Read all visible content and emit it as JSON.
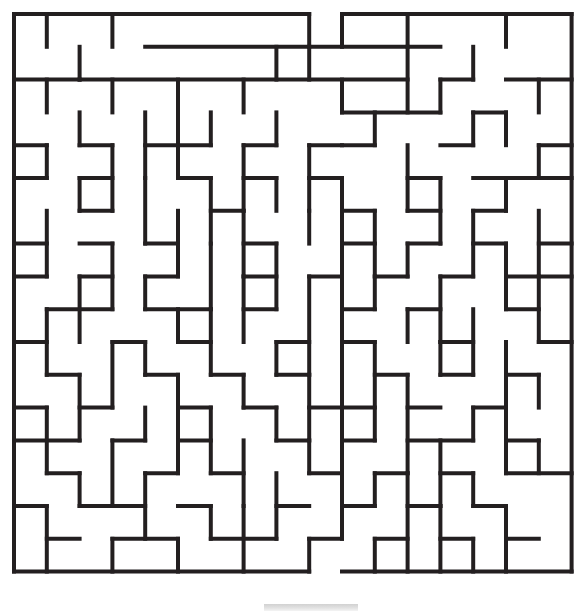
{
  "document": {
    "title": "Maze Puzzle",
    "type": "printable-maze",
    "background_color": "#ffffff"
  },
  "maze": {
    "name": "rectangular-grid-maze",
    "columns": 17,
    "rows": 17,
    "cell_size": 32.8,
    "origin_x": 14,
    "origin_y": 14,
    "wall_color": "#231f20",
    "wall_thickness": 4,
    "entrance": {
      "side": "top",
      "column": 8,
      "label": "start"
    },
    "exit": {
      "side": "bottom",
      "column": 9,
      "label": "finish"
    },
    "horizontal_walls": [
      [
        0,
        0,
        8
      ],
      [
        1,
        0,
        4
      ],
      [
        5,
        0,
        9
      ],
      [
        10,
        0,
        17
      ],
      [
        4,
        1,
        13
      ],
      [
        0,
        2,
        2
      ],
      [
        2,
        2,
        12
      ],
      [
        13,
        2,
        14
      ],
      [
        15,
        2,
        17
      ],
      [
        10,
        3,
        13
      ],
      [
        14,
        3,
        15
      ],
      [
        0,
        4,
        1
      ],
      [
        2,
        4,
        3
      ],
      [
        4,
        4,
        6
      ],
      [
        7,
        4,
        8
      ],
      [
        9,
        4,
        10
      ],
      [
        10,
        4,
        11
      ],
      [
        13,
        4,
        14
      ],
      [
        16,
        4,
        17
      ],
      [
        0,
        5,
        1
      ],
      [
        2,
        5,
        3
      ],
      [
        5,
        5,
        6
      ],
      [
        7,
        5,
        8
      ],
      [
        9,
        5,
        10
      ],
      [
        12,
        5,
        13
      ],
      [
        14,
        5,
        17
      ],
      [
        2,
        6,
        3
      ],
      [
        6,
        6,
        7
      ],
      [
        10,
        6,
        11
      ],
      [
        12,
        6,
        13
      ],
      [
        14,
        6,
        15
      ],
      [
        0,
        7,
        1
      ],
      [
        2,
        7,
        3
      ],
      [
        4,
        7,
        5
      ],
      [
        7,
        7,
        8
      ],
      [
        10,
        7,
        11
      ],
      [
        12,
        7,
        13
      ],
      [
        14,
        7,
        15
      ],
      [
        16,
        7,
        17
      ],
      [
        0,
        8,
        1
      ],
      [
        2,
        8,
        3
      ],
      [
        4,
        8,
        5
      ],
      [
        7,
        8,
        8
      ],
      [
        9,
        8,
        10
      ],
      [
        11,
        8,
        12
      ],
      [
        13,
        8,
        14
      ],
      [
        15,
        8,
        17
      ],
      [
        1,
        9,
        3
      ],
      [
        4,
        9,
        6
      ],
      [
        7,
        9,
        8
      ],
      [
        10,
        9,
        11
      ],
      [
        12,
        9,
        13
      ],
      [
        15,
        9,
        16
      ],
      [
        0,
        10,
        1
      ],
      [
        3,
        10,
        4
      ],
      [
        5,
        10,
        6
      ],
      [
        8,
        10,
        9
      ],
      [
        10,
        10,
        11
      ],
      [
        13,
        10,
        14
      ],
      [
        16,
        10,
        17
      ],
      [
        1,
        11,
        2
      ],
      [
        4,
        11,
        5
      ],
      [
        6,
        11,
        7
      ],
      [
        8,
        11,
        9
      ],
      [
        11,
        11,
        12
      ],
      [
        13,
        11,
        14
      ],
      [
        15,
        11,
        16
      ],
      [
        0,
        12,
        1
      ],
      [
        2,
        12,
        3
      ],
      [
        5,
        12,
        6
      ],
      [
        7,
        12,
        8
      ],
      [
        9,
        12,
        11
      ],
      [
        12,
        12,
        13
      ],
      [
        14,
        12,
        15
      ],
      [
        0,
        13,
        2
      ],
      [
        3,
        13,
        4
      ],
      [
        5,
        13,
        6
      ],
      [
        8,
        13,
        9
      ],
      [
        10,
        13,
        11
      ],
      [
        12,
        13,
        14
      ],
      [
        15,
        13,
        16
      ],
      [
        1,
        14,
        2
      ],
      [
        4,
        14,
        5
      ],
      [
        6,
        14,
        7
      ],
      [
        9,
        14,
        10
      ],
      [
        11,
        14,
        12
      ],
      [
        13,
        14,
        14
      ],
      [
        15,
        14,
        17
      ],
      [
        0,
        15,
        1
      ],
      [
        2,
        15,
        4
      ],
      [
        5,
        15,
        6
      ],
      [
        8,
        15,
        9
      ],
      [
        10,
        15,
        11
      ],
      [
        12,
        15,
        13
      ],
      [
        14,
        15,
        15
      ],
      [
        1,
        16,
        2
      ],
      [
        3,
        16,
        5
      ],
      [
        6,
        16,
        8
      ],
      [
        9,
        16,
        10
      ],
      [
        11,
        16,
        12
      ],
      [
        13,
        16,
        14
      ],
      [
        15,
        16,
        16
      ],
      [
        0,
        17,
        9
      ],
      [
        10,
        17,
        17
      ]
    ],
    "vertical_walls": [
      [
        0,
        0,
        17
      ],
      [
        1,
        0,
        1
      ],
      [
        3,
        0,
        1
      ],
      [
        9,
        0,
        1
      ],
      [
        10,
        0,
        1
      ],
      [
        12,
        0,
        1
      ],
      [
        15,
        0,
        1
      ],
      [
        2,
        1,
        2
      ],
      [
        8,
        1,
        2
      ],
      [
        9,
        1,
        2
      ],
      [
        12,
        1,
        3
      ],
      [
        14,
        1,
        2
      ],
      [
        1,
        2,
        3
      ],
      [
        3,
        2,
        3
      ],
      [
        5,
        2,
        4
      ],
      [
        7,
        2,
        3
      ],
      [
        10,
        2,
        3
      ],
      [
        13,
        2,
        3
      ],
      [
        16,
        2,
        3
      ],
      [
        2,
        3,
        4
      ],
      [
        4,
        3,
        5
      ],
      [
        6,
        3,
        4
      ],
      [
        8,
        3,
        4
      ],
      [
        11,
        3,
        4
      ],
      [
        14,
        3,
        4
      ],
      [
        15,
        3,
        4
      ],
      [
        1,
        4,
        5
      ],
      [
        3,
        4,
        6
      ],
      [
        5,
        4,
        5
      ],
      [
        7,
        4,
        6
      ],
      [
        9,
        4,
        6
      ],
      [
        12,
        4,
        6
      ],
      [
        16,
        4,
        5
      ],
      [
        2,
        5,
        6
      ],
      [
        4,
        5,
        7
      ],
      [
        6,
        5,
        7
      ],
      [
        8,
        5,
        6
      ],
      [
        10,
        5,
        7
      ],
      [
        13,
        5,
        7
      ],
      [
        15,
        5,
        6
      ],
      [
        1,
        6,
        8
      ],
      [
        5,
        6,
        8
      ],
      [
        7,
        6,
        8
      ],
      [
        9,
        6,
        7
      ],
      [
        11,
        6,
        8
      ],
      [
        14,
        6,
        8
      ],
      [
        16,
        6,
        8
      ],
      [
        3,
        7,
        9
      ],
      [
        6,
        7,
        9
      ],
      [
        8,
        7,
        9
      ],
      [
        10,
        7,
        9
      ],
      [
        12,
        7,
        8
      ],
      [
        15,
        7,
        9
      ],
      [
        2,
        8,
        10
      ],
      [
        4,
        8,
        9
      ],
      [
        7,
        8,
        10
      ],
      [
        9,
        8,
        11
      ],
      [
        11,
        8,
        9
      ],
      [
        13,
        8,
        10
      ],
      [
        16,
        8,
        10
      ],
      [
        1,
        9,
        11
      ],
      [
        5,
        9,
        10
      ],
      [
        6,
        9,
        11
      ],
      [
        10,
        9,
        12
      ],
      [
        12,
        9,
        10
      ],
      [
        14,
        9,
        11
      ],
      [
        3,
        10,
        12
      ],
      [
        4,
        10,
        11
      ],
      [
        8,
        10,
        11
      ],
      [
        11,
        10,
        13
      ],
      [
        13,
        10,
        11
      ],
      [
        15,
        10,
        12
      ],
      [
        2,
        11,
        13
      ],
      [
        5,
        11,
        13
      ],
      [
        7,
        11,
        12
      ],
      [
        9,
        11,
        13
      ],
      [
        12,
        11,
        14
      ],
      [
        16,
        11,
        12
      ],
      [
        1,
        12,
        14
      ],
      [
        4,
        12,
        13
      ],
      [
        6,
        12,
        14
      ],
      [
        8,
        12,
        13
      ],
      [
        10,
        12,
        15
      ],
      [
        14,
        12,
        13
      ],
      [
        15,
        12,
        14
      ],
      [
        3,
        13,
        15
      ],
      [
        5,
        13,
        14
      ],
      [
        7,
        13,
        15
      ],
      [
        9,
        13,
        14
      ],
      [
        13,
        13,
        15
      ],
      [
        16,
        13,
        14
      ],
      [
        2,
        14,
        15
      ],
      [
        4,
        14,
        16
      ],
      [
        8,
        14,
        16
      ],
      [
        11,
        14,
        15
      ],
      [
        12,
        14,
        17
      ],
      [
        14,
        14,
        15
      ],
      [
        1,
        15,
        17
      ],
      [
        6,
        15,
        16
      ],
      [
        7,
        15,
        17
      ],
      [
        10,
        15,
        16
      ],
      [
        13,
        15,
        17
      ],
      [
        15,
        15,
        17
      ],
      [
        3,
        16,
        17
      ],
      [
        5,
        16,
        17
      ],
      [
        9,
        16,
        17
      ],
      [
        11,
        16,
        17
      ],
      [
        14,
        16,
        17
      ],
      [
        17,
        0,
        17
      ]
    ]
  },
  "artifacts": {
    "page_shadow_label": "scan-shadow-strip"
  }
}
